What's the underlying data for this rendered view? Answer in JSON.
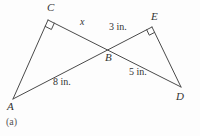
{
  "figure": {
    "caption": "(a)",
    "colors": {
      "line": "#4a4a4a",
      "text": "#333333",
      "background": "#fdfdfd"
    },
    "vertices": [
      {
        "id": "A",
        "label": "A"
      },
      {
        "id": "B",
        "label": "B"
      },
      {
        "id": "C",
        "label": "C"
      },
      {
        "id": "D",
        "label": "D"
      },
      {
        "id": "E",
        "label": "E"
      }
    ],
    "segments": [
      {
        "name": "CB",
        "label": "x"
      },
      {
        "name": "BE",
        "label": "3 in."
      },
      {
        "name": "AB",
        "label": "8 in."
      },
      {
        "name": "BD",
        "label": "5 in."
      }
    ],
    "right_angle_marks": [
      {
        "at": "C"
      },
      {
        "at": "E"
      }
    ]
  }
}
